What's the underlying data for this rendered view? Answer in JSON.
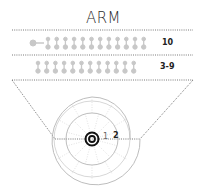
{
  "title": "ARM",
  "rows": [
    {
      "label": "10",
      "count": 12,
      "has_connector": true
    },
    {
      "label": "3-9",
      "count": 12,
      "has_connector": false
    }
  ],
  "rings": [
    {
      "label": "1"
    },
    {
      "label": "2"
    }
  ],
  "colors": {
    "line": "#555555",
    "icon": "#c8c8c8",
    "ring": "#b5b5b5",
    "target": "#111111",
    "text": "#222222"
  }
}
